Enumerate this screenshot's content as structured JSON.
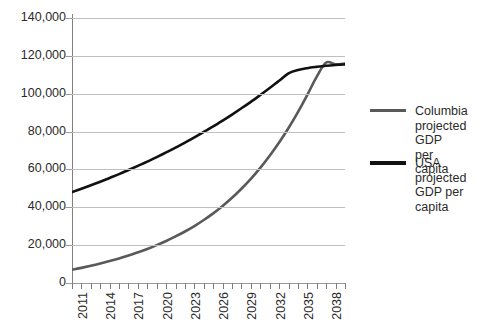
{
  "chart_data": {
    "type": "line",
    "title": "",
    "xlabel": "",
    "ylabel": "",
    "xlim": [
      2011,
      2040
    ],
    "ylim": [
      0,
      140000
    ],
    "grid": true,
    "legend_position": "right",
    "y_ticks": [
      "140,000",
      "120,000",
      "100,000",
      "80,000",
      "60,000",
      "40,000",
      "20,000",
      "0"
    ],
    "y_tick_values": [
      140000,
      120000,
      100000,
      80000,
      60000,
      40000,
      20000,
      0
    ],
    "x_ticks": [
      "2011",
      "2014",
      "2017",
      "2020",
      "2023",
      "2026",
      "2029",
      "2032",
      "2035",
      "2038"
    ],
    "x_tick_values": [
      2011,
      2014,
      2017,
      2020,
      2023,
      2026,
      2029,
      2032,
      2035,
      2038
    ],
    "x_all_years": [
      2011,
      2012,
      2013,
      2014,
      2015,
      2016,
      2017,
      2018,
      2019,
      2020,
      2021,
      2022,
      2023,
      2024,
      2025,
      2026,
      2027,
      2028,
      2029,
      2030,
      2031,
      2032,
      2033,
      2034,
      2035,
      2036,
      2037,
      2038,
      2039,
      2040
    ],
    "series": [
      {
        "name": "Columbia projected GDP per capita",
        "color": "#595959",
        "x": [
          2011,
          2012,
          2013,
          2014,
          2015,
          2016,
          2017,
          2018,
          2019,
          2020,
          2021,
          2022,
          2023,
          2024,
          2025,
          2026,
          2027,
          2028,
          2029,
          2030,
          2031,
          2032,
          2033,
          2034,
          2035,
          2036,
          2037,
          2038,
          2039,
          2040
        ],
        "values": [
          7000,
          8000,
          9100,
          10300,
          11600,
          13000,
          14500,
          16200,
          18000,
          20000,
          22200,
          24600,
          27200,
          30100,
          33300,
          36800,
          40700,
          45000,
          49800,
          55000,
          60800,
          67200,
          74200,
          81900,
          90300,
          99400,
          109000,
          116500,
          115500,
          116000
        ]
      },
      {
        "name": "USA projected GDP per capita",
        "color": "#111111",
        "x": [
          2011,
          2012,
          2013,
          2014,
          2015,
          2016,
          2017,
          2018,
          2019,
          2020,
          2021,
          2022,
          2023,
          2024,
          2025,
          2026,
          2027,
          2028,
          2029,
          2030,
          2031,
          2032,
          2033,
          2034,
          2035,
          2036,
          2037,
          2038,
          2039,
          2040
        ],
        "values": [
          48000,
          49800,
          51600,
          53500,
          55500,
          57500,
          59700,
          61900,
          64100,
          66500,
          69000,
          71500,
          74200,
          76900,
          79800,
          82700,
          85800,
          89000,
          92300,
          95700,
          99300,
          103000,
          106800,
          110800,
          112500,
          113500,
          114200,
          114800,
          115200,
          115500
        ]
      }
    ],
    "annotations": []
  },
  "legend": {
    "entries": [
      {
        "label": "Columbia\nprojected GDP\nper capita",
        "color": "#595959"
      },
      {
        "label": "USA projected\nGDP per capita",
        "color": "#111111"
      }
    ]
  }
}
